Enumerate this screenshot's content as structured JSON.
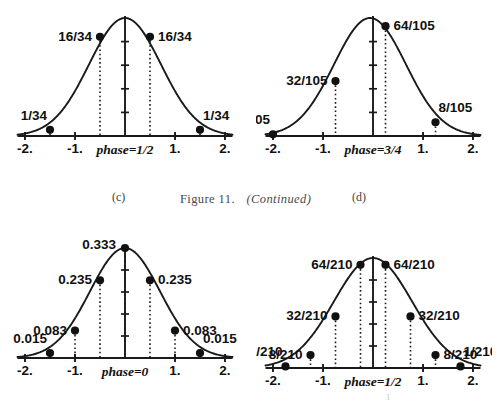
{
  "figure": {
    "caption_prefix": "Figure 11.",
    "caption_suffix": "(Continued)",
    "page_number": "1"
  },
  "panels": [
    {
      "id": "c",
      "letter": "(c)",
      "phase_label": "phase=1/2",
      "axis": {
        "xticks": [
          "-2.",
          "-1.",
          "1.",
          "2."
        ],
        "xtick_values": [
          -2,
          -1,
          1,
          2
        ],
        "xlim": [
          -2.15,
          2.15
        ],
        "ytick_count": 4
      },
      "points": [
        {
          "x": -1.5,
          "label": "1/34",
          "value": 0.0294,
          "label_side": "left-up"
        },
        {
          "x": -0.5,
          "label": "16/34",
          "value": 0.4706,
          "label_side": "left"
        },
        {
          "x": 0.5,
          "label": "16/34",
          "value": 0.4706,
          "label_side": "right"
        },
        {
          "x": 1.5,
          "label": "1/34",
          "value": 0.0294,
          "label_side": "right-up"
        }
      ]
    },
    {
      "id": "d",
      "letter": "(d)",
      "phase_label": "phase=3/4",
      "axis": {
        "xticks": [
          "-2.",
          "-1.",
          "1.",
          "2."
        ],
        "xtick_values": [
          -2,
          -1,
          1,
          2
        ],
        "xlim": [
          -2.15,
          2.15
        ],
        "ytick_count": 4
      },
      "points": [
        {
          "x": -2.0,
          "label": "1/105",
          "value": 0.0095,
          "label_side": "left-up"
        },
        {
          "x": -0.75,
          "label": "32/105",
          "value": 0.3048,
          "label_side": "left"
        },
        {
          "x": 0.25,
          "label": "64/105",
          "value": 0.6095,
          "label_side": "right"
        },
        {
          "x": 1.25,
          "label": "8/105",
          "value": 0.0762,
          "label_side": "right-up"
        }
      ]
    },
    {
      "id": "e",
      "letter": "",
      "phase_label": "phase=0",
      "axis": {
        "xticks": [
          "-2.",
          "-1.",
          "1.",
          "2."
        ],
        "xtick_values": [
          -2,
          -1,
          1,
          2
        ],
        "xlim": [
          -2.15,
          2.15
        ],
        "ytick_count": 4
      },
      "points": [
        {
          "x": -1.5,
          "label": "0.015",
          "value": 0.015,
          "label_side": "left-up"
        },
        {
          "x": -1.0,
          "label": "0.083",
          "value": 0.083,
          "label_side": "left"
        },
        {
          "x": -0.5,
          "label": "0.235",
          "value": 0.235,
          "label_side": "left"
        },
        {
          "x": 0.0,
          "label": "0.333",
          "value": 0.333,
          "label_side": "top-left"
        },
        {
          "x": 0.5,
          "label": "0.235",
          "value": 0.235,
          "label_side": "right"
        },
        {
          "x": 1.0,
          "label": "0.083",
          "value": 0.083,
          "label_side": "right"
        },
        {
          "x": 1.5,
          "label": "0.015",
          "value": 0.015,
          "label_side": "right-up"
        }
      ]
    },
    {
      "id": "f",
      "letter": "",
      "phase_label": "phase=1/2",
      "axis": {
        "xticks": [
          "-2.",
          "-1.",
          "1.",
          "2."
        ],
        "xtick_values": [
          -2,
          -1,
          1,
          2
        ],
        "xlim": [
          -2.15,
          2.15
        ],
        "ytick_count": 4
      },
      "points": [
        {
          "x": -1.75,
          "label": "1/210",
          "value": 0.0048,
          "label_side": "left-up"
        },
        {
          "x": -1.25,
          "label": "8/210",
          "value": 0.0381,
          "label_side": "left"
        },
        {
          "x": -0.75,
          "label": "32/210",
          "value": 0.1524,
          "label_side": "left"
        },
        {
          "x": -0.25,
          "label": "64/210",
          "value": 0.3048,
          "label_side": "left"
        },
        {
          "x": 0.25,
          "label": "64/210",
          "value": 0.3048,
          "label_side": "right"
        },
        {
          "x": 0.75,
          "label": "32/210",
          "value": 0.1524,
          "label_side": "right"
        },
        {
          "x": 1.25,
          "label": "8/210",
          "value": 0.0381,
          "label_side": "right"
        },
        {
          "x": 1.75,
          "label": "1/210",
          "value": 0.0048,
          "label_side": "right-up"
        }
      ]
    }
  ],
  "chart_data": {
    "type": "line",
    "title": "Figure 11. (Continued)",
    "xlabel": "phase",
    "ylabel": "",
    "xlim": [
      -2.15,
      2.15
    ],
    "grid": false,
    "legend": "none",
    "subplots": [
      {
        "panel": "(c)",
        "annotation": "phase=1/2",
        "x": [
          -1.5,
          -0.5,
          0.5,
          1.5
        ],
        "labels": [
          "1/34",
          "16/34",
          "16/34",
          "1/34"
        ],
        "values": [
          0.0294,
          0.4706,
          0.4706,
          0.0294
        ],
        "curve": "gaussian-envelope",
        "xticks": [
          -2,
          -1,
          1,
          2
        ],
        "xticklabels": [
          "-2.",
          "-1.",
          "1.",
          "2."
        ]
      },
      {
        "panel": "(d)",
        "annotation": "phase=3/4",
        "x": [
          -2.0,
          -0.75,
          0.25,
          1.25
        ],
        "labels": [
          "1/105",
          "32/105",
          "64/105",
          "8/105"
        ],
        "values": [
          0.0095,
          0.3048,
          0.6095,
          0.0762
        ],
        "curve": "gaussian-envelope",
        "xticks": [
          -2,
          -1,
          1,
          2
        ],
        "xticklabels": [
          "-2.",
          "-1.",
          "1.",
          "2."
        ]
      },
      {
        "panel": "(e)",
        "annotation": "phase=0",
        "x": [
          -1.5,
          -1.0,
          -0.5,
          0.0,
          0.5,
          1.0,
          1.5
        ],
        "labels": [
          "0.015",
          "0.083",
          "0.235",
          "0.333",
          "0.235",
          "0.083",
          "0.015"
        ],
        "values": [
          0.015,
          0.083,
          0.235,
          0.333,
          0.235,
          0.083,
          0.015
        ],
        "curve": "gaussian-envelope",
        "xticks": [
          -2,
          -1,
          1,
          2
        ],
        "xticklabels": [
          "-2.",
          "-1.",
          "1.",
          "2."
        ]
      },
      {
        "panel": "(f)",
        "annotation": "phase=1/2",
        "x": [
          -1.75,
          -1.25,
          -0.75,
          -0.25,
          0.25,
          0.75,
          1.25,
          1.75
        ],
        "labels": [
          "1/210",
          "8/210",
          "32/210",
          "64/210",
          "64/210",
          "32/210",
          "8/210",
          "1/210"
        ],
        "values": [
          0.0048,
          0.0381,
          0.1524,
          0.3048,
          0.3048,
          0.1524,
          0.0381,
          0.0048
        ],
        "curve": "gaussian-envelope",
        "xticks": [
          -2,
          -1,
          1,
          2
        ],
        "xticklabels": [
          "-2.",
          "-1.",
          "1.",
          "2."
        ]
      }
    ]
  }
}
